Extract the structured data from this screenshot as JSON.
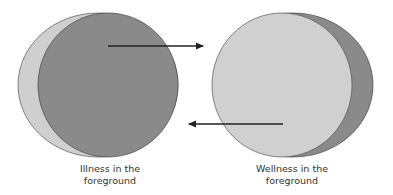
{
  "diagram": {
    "left_group": {
      "caption_line1": "Illness in the",
      "caption_line2": "foreground",
      "front_color": "#8a8a8a",
      "back_color": "#cfcfcf"
    },
    "right_group": {
      "caption_line1": "Wellness in the",
      "caption_line2": "foreground",
      "front_color": "#cfcfcf",
      "back_color": "#8a8a8a"
    },
    "arrows": [
      {
        "direction": "right",
        "from": "illness",
        "to": "wellness"
      },
      {
        "direction": "left",
        "from": "wellness",
        "to": "illness"
      }
    ],
    "stroke_color": "#333333"
  }
}
